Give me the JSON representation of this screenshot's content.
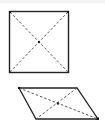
{
  "figure": {
    "shapes": [
      {
        "name": "square",
        "kind": "square",
        "diagonals": "dashed",
        "intersection_marked": true
      },
      {
        "name": "parallelogram",
        "kind": "parallelogram",
        "diagonals": "dashed",
        "intersection_marked": true
      }
    ],
    "colors": {
      "stroke": "#222222",
      "dashed": "#555555",
      "background": "#ffffff"
    }
  }
}
